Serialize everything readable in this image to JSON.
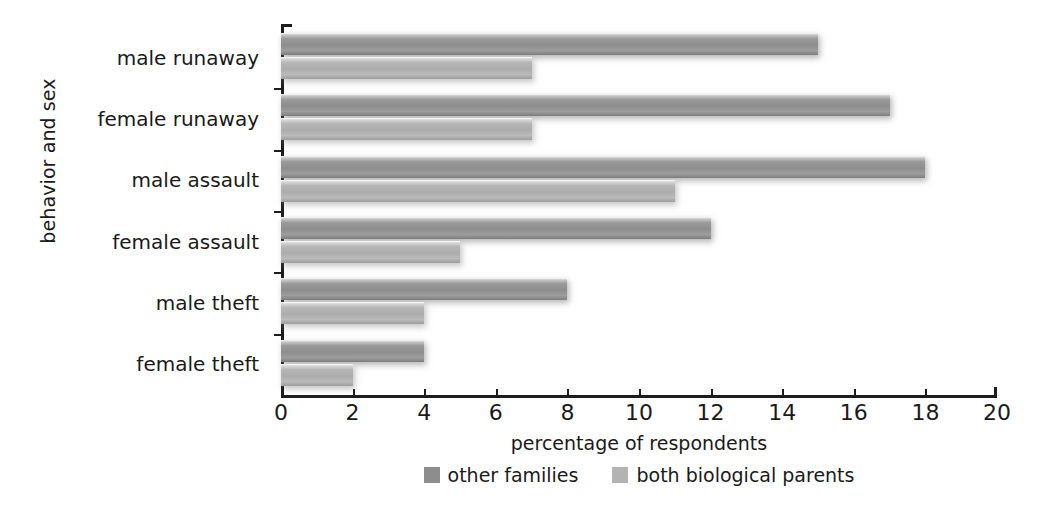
{
  "chart_data": {
    "type": "bar",
    "orientation": "horizontal",
    "title": "",
    "xlabel": "percentage of respondents",
    "ylabel": "behavior and sex",
    "xlim": [
      0,
      20
    ],
    "xticks": [
      0,
      2,
      4,
      6,
      8,
      10,
      12,
      14,
      16,
      18,
      20
    ],
    "grid": false,
    "legend_position": "bottom-center",
    "categories": [
      "male runaway",
      "female runaway",
      "male assault",
      "female assault",
      "male theft",
      "female theft"
    ],
    "series": [
      {
        "name": "other families",
        "color": "#8d8d8d",
        "values": [
          15,
          17,
          18,
          12,
          8,
          4
        ]
      },
      {
        "name": "both biological parents",
        "color": "#b3b3b3",
        "values": [
          7,
          7,
          11,
          5,
          4,
          2
        ]
      }
    ]
  },
  "axes": {
    "x_title": "percentage of respondents",
    "y_title": "behavior and sex",
    "x_tick_labels": [
      "0",
      "2",
      "4",
      "6",
      "8",
      "10",
      "12",
      "14",
      "16",
      "18",
      "20"
    ],
    "y_tick_labels": [
      "male runaway",
      "female runaway",
      "male assault",
      "female assault",
      "male theft",
      "female theft"
    ]
  },
  "legend": {
    "items": [
      {
        "label": "other families",
        "color": "#8d8d8d"
      },
      {
        "label": "both biological parents",
        "color": "#b3b3b3"
      }
    ]
  },
  "colors": {
    "series_dark": "#8d8d8d",
    "series_light": "#b3b3b3",
    "axis": "#1d1d1d",
    "background": "#ffffff",
    "text": "#1a1a1a"
  }
}
